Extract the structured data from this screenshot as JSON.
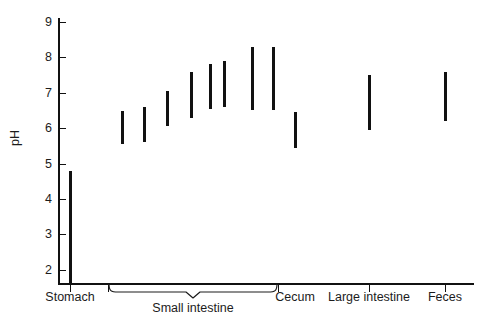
{
  "chart_data": {
    "type": "bar",
    "title": "",
    "subtitle": "",
    "xlabel": "",
    "ylabel": "pH",
    "ylim": [
      1.35,
      9.35
    ],
    "yticks": [
      2,
      3,
      4,
      5,
      6,
      7,
      8,
      9
    ],
    "ytick_labels": [
      "2",
      "3",
      "4",
      "5",
      "6",
      "7",
      "8",
      "9"
    ],
    "grid": false,
    "legend": false,
    "orientation": "vertical",
    "note": "Floating range bars: each bar spans the min-to-max pH observed at that gut site.",
    "categories": [
      "Stomach",
      "Small intestine",
      "Cecum",
      "Large intestine",
      "Feces"
    ],
    "group_brace": {
      "label": "Small intestine",
      "spans_segments": 7
    },
    "series": [
      {
        "name": "pH range",
        "color": "#111111",
        "points": [
          {
            "label": "Stomach",
            "group": "Stomach",
            "x_px": 70,
            "low": 1.6,
            "high": 4.8
          },
          {
            "label": "Small intestine 1",
            "group": "Small intestine",
            "x_px": 122,
            "low": 5.55,
            "high": 6.5
          },
          {
            "label": "Small intestine 2",
            "group": "Small intestine",
            "x_px": 144,
            "low": 5.6,
            "high": 6.6
          },
          {
            "label": "Small intestine 3",
            "group": "Small intestine",
            "x_px": 167,
            "low": 6.05,
            "high": 7.05
          },
          {
            "label": "Small intestine 4",
            "group": "Small intestine",
            "x_px": 191,
            "low": 6.3,
            "high": 7.6
          },
          {
            "label": "Small intestine 5",
            "group": "Small intestine",
            "x_px": 210,
            "low": 6.55,
            "high": 7.8
          },
          {
            "label": "Small intestine 6",
            "group": "Small intestine",
            "x_px": 224,
            "low": 6.6,
            "high": 7.9
          },
          {
            "label": "Small intestine 7",
            "group": "Small intestine",
            "x_px": 252,
            "low": 6.5,
            "high": 8.3
          },
          {
            "label": "Small intestine 8",
            "group": "Small intestine",
            "x_px": 273,
            "low": 6.5,
            "high": 8.3
          },
          {
            "label": "Cecum",
            "group": "Cecum",
            "x_px": 295,
            "low": 5.45,
            "high": 6.45
          },
          {
            "label": "Large intestine",
            "group": "Large intestine",
            "x_px": 369,
            "low": 5.95,
            "high": 7.5
          },
          {
            "label": "Feces",
            "group": "Feces",
            "x_px": 445,
            "low": 6.2,
            "high": 7.6
          }
        ]
      }
    ],
    "x_group_ticks": [
      {
        "label": "Stomach",
        "x_px": 70
      },
      {
        "label": "Small intestine left",
        "x_px": 108
      },
      {
        "label": "Small intestine right",
        "x_px": 278
      },
      {
        "label": "Large intestine",
        "x_px": 369
      },
      {
        "label": "Feces",
        "x_px": 445
      }
    ]
  },
  "axis": {
    "y_title": "pH",
    "ticks": [
      {
        "value": 9,
        "label": "9"
      },
      {
        "value": 8,
        "label": "8"
      },
      {
        "value": 7,
        "label": "7"
      },
      {
        "value": 6,
        "label": "6"
      },
      {
        "value": 5,
        "label": "5"
      },
      {
        "value": 4,
        "label": "4"
      },
      {
        "value": 3,
        "label": "3"
      },
      {
        "value": 2,
        "label": "2"
      }
    ]
  },
  "categories": {
    "stomach": "Stomach",
    "small_intestine": "Small intestine",
    "cecum": "Cecum",
    "large_intestine": "Large intestine",
    "feces": "Feces"
  }
}
